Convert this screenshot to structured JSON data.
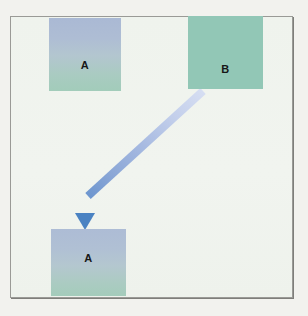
{
  "page": {
    "top_scan_text": "",
    "background_color": "#f2f2ee"
  },
  "panel": {
    "background_color": "#eef2ec",
    "border_color": "#9a9a96"
  },
  "diagram": {
    "type": "node-link-diagram",
    "nodes": [
      {
        "id": "a-top",
        "label": "A",
        "shape": "rectangle",
        "fill_kind": "gradient",
        "fill_top_color": "#aab9d4",
        "fill_bottom_color": "#a2ccba"
      },
      {
        "id": "b",
        "label": "B",
        "shape": "rectangle",
        "fill_kind": "solid",
        "fill_color": "#92c7b6"
      },
      {
        "id": "a-bottom",
        "label": "A",
        "shape": "rectangle",
        "fill_kind": "gradient",
        "fill_top_color": "#adbcd5",
        "fill_bottom_color": "#a4ccbb"
      }
    ],
    "edges": [
      {
        "id": "edge-a-top-to-a-bottom",
        "from": "a-top",
        "to": "a-bottom",
        "orientation": "vertical",
        "arrowhead": "solid-triangle",
        "color_start": "#9fb6dd",
        "color_end": "#4a82c2"
      },
      {
        "id": "edge-b-to-a-bottom",
        "from": "b",
        "to": "a-bottom",
        "orientation": "diagonal",
        "arrowhead": "none",
        "color_start": "#cdd7ef",
        "color_end": "#6d96cf"
      }
    ],
    "arrow_color": "#4a82c2"
  }
}
